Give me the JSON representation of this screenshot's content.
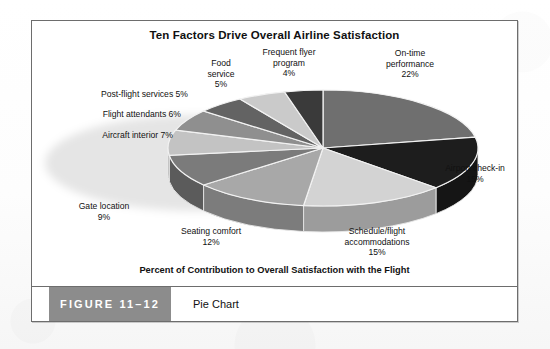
{
  "figure": {
    "tag": "FIGURE 11–12",
    "caption": "Pie Chart"
  },
  "axis_caption": "Percent of Contribution to Overall Satisfaction with the Flight",
  "chart_data": {
    "type": "pie",
    "title": "Ten Factors Drive Overall Airline Satisfaction",
    "xlabel": "Percent of Contribution to Overall Satisfaction with the Flight",
    "ylabel": "",
    "legend": "none",
    "units": "percent",
    "three_d": true,
    "start_angle_deg": -90,
    "direction": "clockwise",
    "categories": [
      "On-time performance",
      "Airport check-in",
      "Schedule/flight accommodations",
      "Seating comfort",
      "Gate location",
      "Aircraft interior",
      "Flight attendants",
      "Post-flight services",
      "Food service",
      "Frequent flyer program"
    ],
    "values": [
      22,
      15,
      15,
      12,
      9,
      7,
      6,
      5,
      5,
      4
    ],
    "colors": [
      "#6f6f6f",
      "#1d1d1d",
      "#d3d3d3",
      "#a8a8a8",
      "#7b7b7b",
      "#c3c3c3",
      "#8f8f8f",
      "#636363",
      "#cacaca",
      "#3a3a3a"
    ],
    "slices": [
      {
        "label": "On-time performance",
        "value": 22,
        "value_text": "22%",
        "color": "#6f6f6f"
      },
      {
        "label": "Airport check-in",
        "value": 15,
        "value_text": "15%",
        "color": "#1d1d1d"
      },
      {
        "label": "Schedule/flight accommodations",
        "value": 15,
        "value_text": "15%",
        "color": "#d3d3d3"
      },
      {
        "label": "Seating comfort",
        "value": 12,
        "value_text": "12%",
        "color": "#a8a8a8"
      },
      {
        "label": "Gate location",
        "value": 9,
        "value_text": "9%",
        "color": "#7b7b7b"
      },
      {
        "label": "Aircraft interior",
        "value": 7,
        "value_text": "7%",
        "color": "#c3c3c3"
      },
      {
        "label": "Flight attendants",
        "value": 6,
        "value_text": "6%",
        "color": "#8f8f8f"
      },
      {
        "label": "Post-flight services",
        "value": 5,
        "value_text": "5%",
        "color": "#636363"
      },
      {
        "label": "Food service",
        "value": 5,
        "value_text": "5%",
        "color": "#cacaca"
      },
      {
        "label": "Frequent flyer program",
        "value": 4,
        "value_text": "4%",
        "color": "#3a3a3a"
      }
    ]
  },
  "labels": {
    "on_time_performance": "On-time\nperformance\n22%",
    "airport_check_in": "Airport check-in\n15%",
    "schedule_flight": "Schedule/flight\naccommodations\n15%",
    "seating_comfort": "Seating comfort\n12%",
    "gate_location": "Gate location\n9%",
    "aircraft_interior": "Aircraft interior 7%",
    "flight_attendants": "Flight attendants 6%",
    "post_flight_services": "Post-flight services 5%",
    "food_service": "Food\nservice\n5%",
    "frequent_flyer": "Frequent flyer\nprogram\n4%"
  }
}
